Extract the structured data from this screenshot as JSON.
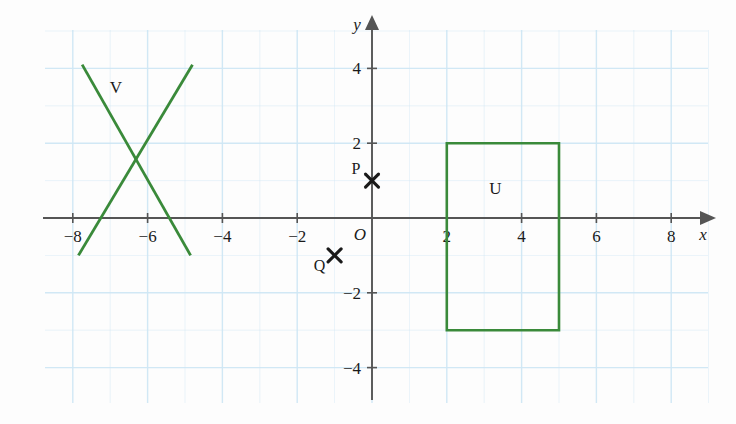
{
  "figure": {
    "type": "coordinate-grid-diagram",
    "background_color": "#fdfdfd",
    "grid_color": "#cfe7f5",
    "axis_color": "#555555",
    "shape_color": "#3a8a3a",
    "marker_color": "#1a1a1a"
  },
  "axes": {
    "x_label": "x",
    "y_label": "y",
    "origin_label": "O",
    "x_ticks": [
      {
        "value": -8,
        "label": "−8"
      },
      {
        "value": -6,
        "label": "−6"
      },
      {
        "value": -4,
        "label": "−4"
      },
      {
        "value": -2,
        "label": "−2"
      },
      {
        "value": 2,
        "label": "2"
      },
      {
        "value": 4,
        "label": "4"
      },
      {
        "value": 6,
        "label": "6"
      },
      {
        "value": 8,
        "label": "8"
      }
    ],
    "y_ticks": [
      {
        "value": 4,
        "label": "4"
      },
      {
        "value": 2,
        "label": "2"
      },
      {
        "value": -2,
        "label": "−2"
      },
      {
        "value": -4,
        "label": "−4"
      }
    ],
    "x_range": [
      -9,
      9
    ],
    "y_range": [
      -5,
      5
    ]
  },
  "shapes": [
    {
      "name": "U",
      "label": "U",
      "kind": "rectangle",
      "label_position": {
        "x": 3.3,
        "y": 0.65
      },
      "vertices": [
        {
          "x": 2,
          "y": 2
        },
        {
          "x": 5,
          "y": 2
        },
        {
          "x": 5,
          "y": -3
        },
        {
          "x": 2,
          "y": -3
        }
      ]
    },
    {
      "name": "V",
      "label": "V",
      "kind": "cross",
      "label_position": {
        "x": -6.85,
        "y": 3.35
      },
      "segments": [
        {
          "from": {
            "x": -7.75,
            "y": 4.1
          },
          "to": {
            "x": -4.85,
            "y": -1.0
          }
        },
        {
          "from": {
            "x": -7.85,
            "y": -1.0
          },
          "to": {
            "x": -4.8,
            "y": 4.1
          }
        }
      ]
    }
  ],
  "points": [
    {
      "name": "P",
      "label": "P",
      "x": 0,
      "y": 1,
      "marker": "cross-x",
      "label_offset": {
        "dx": -16,
        "dy": -7
      }
    },
    {
      "name": "Q",
      "label": "Q",
      "x": -1,
      "y": -1,
      "marker": "cross-x",
      "label_offset": {
        "dx": -15,
        "dy": 16
      }
    }
  ]
}
